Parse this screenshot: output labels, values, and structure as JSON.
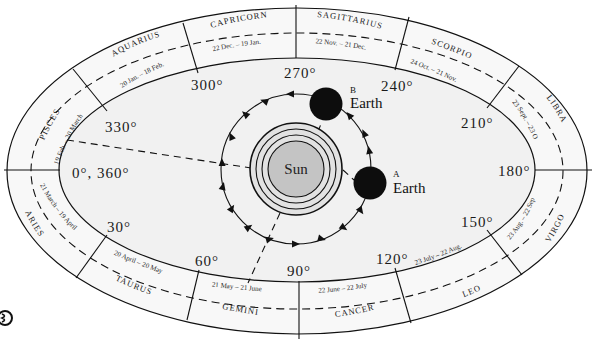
{
  "diagram": {
    "sun_label": "Sun",
    "earth_positions": [
      {
        "marker": "A",
        "label": "Earth"
      },
      {
        "marker": "B",
        "label": "Earth"
      }
    ],
    "zodiac": [
      {
        "sign": "PISCES",
        "dates": "19 Feb. – 20 March"
      },
      {
        "sign": "AQUARIUS",
        "dates": "20 Jan. – 18 Feb."
      },
      {
        "sign": "CAPRICORN",
        "dates": "22 Dec. – 19 Jan."
      },
      {
        "sign": "SAGITTARIUS",
        "dates": "22 Nov. – 21 Dec."
      },
      {
        "sign": "SCORPIO",
        "dates": "24 Oct. – 21 Nov."
      },
      {
        "sign": "LIBRA",
        "dates": "23 Sept. – 23 Oct."
      },
      {
        "sign": "VIRGO",
        "dates": "23 Aug. – 22 Sept."
      },
      {
        "sign": "LEO",
        "dates": "23 July – 22 Aug."
      },
      {
        "sign": "CANCER",
        "dates": "22 June – 22 July"
      },
      {
        "sign": "GEMINI",
        "dates": "21 May – 21 June"
      },
      {
        "sign": "TAURUS",
        "dates": "20 April – 20 May"
      },
      {
        "sign": "ARIES",
        "dates": "21 March – 19 April"
      }
    ],
    "degrees": {
      "d0": "0°, 360°",
      "d30": "30°",
      "d60": "60°",
      "d90": "90°",
      "d120": "120°",
      "d150": "150°",
      "d180": "180°",
      "d210": "210°",
      "d240": "240°",
      "d270": "270°",
      "d300": "300°",
      "d330": "330°"
    },
    "colors": {
      "sun_fill": "#c4c4c4",
      "band_fill": "#f7f7f7",
      "inner_fill": "#f2f2f2",
      "ink": "#111111"
    }
  }
}
